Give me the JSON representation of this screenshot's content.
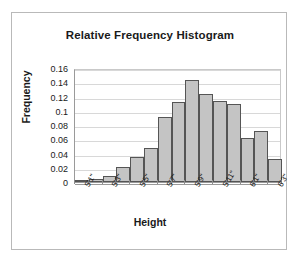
{
  "chart_data": {
    "type": "bar",
    "title": "Relative Frequency Histogram",
    "xlabel": "Height",
    "ylabel": "Frequency",
    "categories": [
      "5'1\"",
      "5'2\"",
      "5'3\"",
      "5'4\"",
      "5'5\"",
      "5'6\"",
      "5'7\"",
      "5'8\"",
      "5'9\"",
      "5'10\"",
      "5'11\"",
      "6'0\"",
      "6'1\"",
      "6'2\"",
      "6'3\""
    ],
    "values": [
      0.001,
      0.004,
      0.008,
      0.021,
      0.035,
      0.048,
      0.091,
      0.112,
      0.143,
      0.123,
      0.114,
      0.11,
      0.062,
      0.072,
      0.032
    ],
    "ylim": [
      0,
      0.16
    ],
    "ytick_values": [
      0,
      0.02,
      0.04,
      0.06,
      0.08,
      0.1,
      0.12,
      0.14,
      0.16
    ],
    "ytick_labels": [
      "0",
      "0.02",
      "0.04",
      "0.06",
      "0.08",
      "0.1",
      "0.12",
      "0.14",
      "0.16"
    ],
    "xtick_labels": [
      "5'1\"",
      "5'3\"",
      "5'5\"",
      "5'7\"",
      "5'9\"",
      "5'11\"",
      "6'1\"",
      "6'3\""
    ],
    "xtick_indices": [
      0,
      2,
      4,
      6,
      8,
      10,
      12,
      14
    ],
    "grid": true,
    "legend": false,
    "bar_fill_color": "#c4c4c4",
    "bar_border_color": "#555555"
  }
}
